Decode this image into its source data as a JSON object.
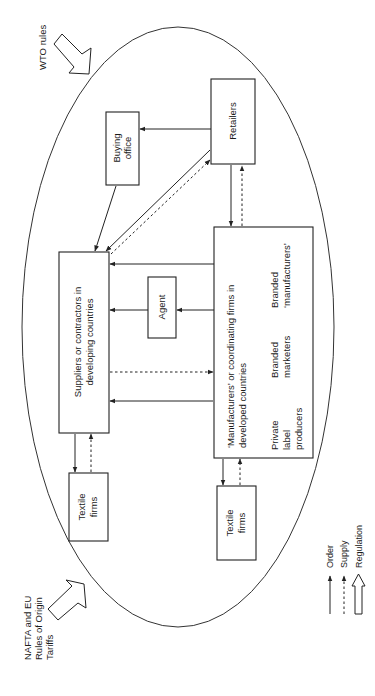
{
  "diagram": {
    "orientation": "rotated-90-ccw",
    "external": {
      "wto": "WTO rules",
      "nafta_line1": "NAFTA and EU",
      "nafta_line2": "Rules of Origin",
      "nafta_line3": "Tariffs"
    },
    "nodes": {
      "retailers": "Retailers",
      "buying_office_line1": "Buying",
      "buying_office_line2": "office",
      "suppliers_line1": "Suppliers or contractors in",
      "suppliers_line2": "developing countries",
      "agent": "Agent",
      "manufacturers_line1": "‘Manufacturers’ or coordinating firms in",
      "manufacturers_line2": "developed countries",
      "sub_private_line1": "Private",
      "sub_private_line2": "label",
      "sub_private_line3": "producers",
      "sub_branded_mkt_line1": "Branded",
      "sub_branded_mkt_line2": "marketers",
      "sub_branded_mfr_line1": "Branded",
      "sub_branded_mfr_line2": "‘manufacturers’",
      "textile_left_line1": "Textile",
      "textile_left_line2": "firms",
      "textile_right_line1": "Textile",
      "textile_right_line2": "firms"
    },
    "edges": [
      {
        "from": "Retailers",
        "to": "Buying office",
        "type": "order"
      },
      {
        "from": "Buying office",
        "to": "Suppliers or contractors in developing countries",
        "type": "order"
      },
      {
        "from": "Retailers",
        "to": "Suppliers or contractors in developing countries",
        "type": "order"
      },
      {
        "from": "Suppliers or contractors in developing countries",
        "to": "Retailers",
        "type": "supply"
      },
      {
        "from": "Retailers",
        "to": "Manufacturers or coordinating firms",
        "type": "order"
      },
      {
        "from": "Manufacturers or coordinating firms",
        "to": "Retailers",
        "type": "supply"
      },
      {
        "from": "Manufacturers or coordinating firms",
        "to": "Suppliers or contractors in developing countries",
        "type": "order"
      },
      {
        "from": "Manufacturers or coordinating firms",
        "to": "Agent",
        "type": "order"
      },
      {
        "from": "Agent",
        "to": "Suppliers or contractors in developing countries",
        "type": "order"
      },
      {
        "from": "Suppliers or contractors in developing countries",
        "to": "Manufacturers or coordinating firms",
        "type": "supply"
      },
      {
        "from": "Manufacturers or coordinating firms",
        "to": "Suppliers or contractors in developing countries",
        "type": "order"
      },
      {
        "from": "Suppliers or contractors in developing countries",
        "to": "Textile firms (left)",
        "type": "order"
      },
      {
        "from": "Textile firms (left)",
        "to": "Suppliers or contractors in developing countries",
        "type": "supply"
      },
      {
        "from": "Manufacturers or coordinating firms",
        "to": "Textile firms (right)",
        "type": "order"
      },
      {
        "from": "Textile firms (right)",
        "to": "Manufacturers or coordinating firms",
        "type": "supply"
      },
      {
        "from": "WTO rules",
        "to": "system",
        "type": "regulation"
      },
      {
        "from": "NAFTA and EU Rules of Origin Tariffs",
        "to": "system",
        "type": "regulation"
      }
    ],
    "legend": {
      "order": "Order",
      "supply": "Supply",
      "regulation": "Regulation"
    },
    "colors": {
      "line": "#222222",
      "background": "#ffffff"
    }
  }
}
